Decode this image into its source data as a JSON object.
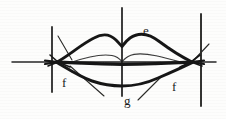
{
  "figure": {
    "medium": "scanned pen-and-ink line drawing",
    "background_color": "#fdfdfc",
    "ink_color": "#1a1a1a",
    "width": 226,
    "height": 119
  },
  "labels": [
    {
      "id": "e",
      "text": "e",
      "x": 143,
      "y": 24,
      "refers_to": "upper-lip-outer-contour"
    },
    {
      "id": "f-left",
      "text": "f",
      "x": 62,
      "y": 76,
      "refers_to": "left-mouth-corner"
    },
    {
      "id": "f-right",
      "text": "f",
      "x": 172,
      "y": 80,
      "refers_to": "right-mouth-corner"
    },
    {
      "id": "g",
      "text": "g",
      "x": 124,
      "y": 94,
      "refers_to": "lower-lip-outer-contour"
    }
  ],
  "construction_lines": {
    "horizontal_axis": {
      "x1": 12,
      "y1": 62,
      "x2": 216,
      "y2": 62
    },
    "verticals": [
      {
        "id": "left-vertical",
        "x": 52,
        "y1": 27,
        "y2": 92
      },
      {
        "id": "center-vertical",
        "x": 122,
        "y1": 8,
        "y2": 96
      },
      {
        "id": "right-vertical",
        "x": 201,
        "y1": 14,
        "y2": 106
      }
    ]
  },
  "leader_lines": [
    {
      "id": "leader-f-left",
      "x1": 58,
      "y1": 36,
      "x2": 72,
      "y2": 60
    },
    {
      "id": "leader-f-left-lower",
      "x1": 70,
      "y1": 66,
      "x2": 104,
      "y2": 96
    },
    {
      "id": "leader-f-right",
      "x1": 193,
      "y1": 61,
      "x2": 209,
      "y2": 44
    },
    {
      "id": "leader-g",
      "x1": 162,
      "y1": 76,
      "x2": 138,
      "y2": 100
    }
  ],
  "lip_contours": {
    "upper_lip_outer": "cupid's bow with two peaks meeting at the philtrum notch on the centre line",
    "mouth_line": "dark line joining the two corners with a slight central dip",
    "inner_upper_lip": "thin line just below the mouth line forming the vermilion edge",
    "lower_lip_outer": "shallow downward arc from corner to corner"
  }
}
